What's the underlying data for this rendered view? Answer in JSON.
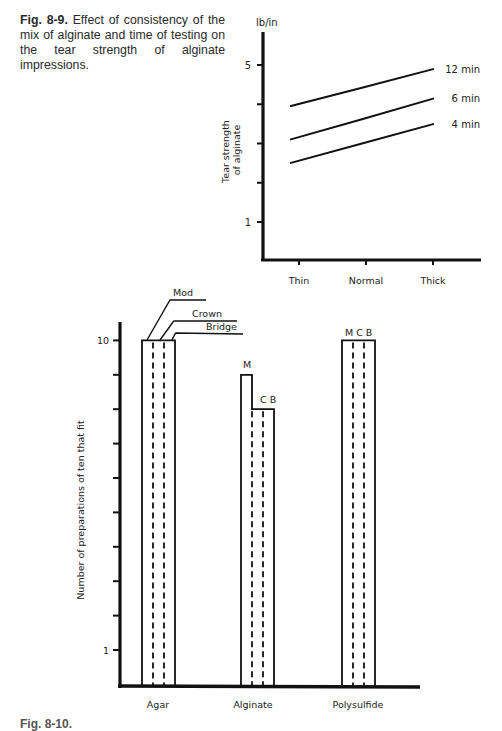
{
  "caption_top": {
    "label": "Fig. 8-9.",
    "text": " Effect of consistency of the mix of alginate and time of testing on the tear strength of alginate impressions."
  },
  "caption_bottom": {
    "label": "Fig. 8-10."
  },
  "chart_data": [
    {
      "type": "line",
      "title": "Effect of consistency of the mix of alginate and time of testing on the tear strength of alginate impressions",
      "xlabel": "",
      "ylabel": "Tear strength of alginate",
      "y_unit": "lb/in",
      "categories": [
        "Thin",
        "Normal",
        "Thick"
      ],
      "y_ticks": [
        1,
        2,
        3,
        4,
        5
      ],
      "y_tick_labels": {
        "1": "1",
        "5": "5"
      },
      "ylim": [
        0,
        6
      ],
      "grid": false,
      "legend_position": "inline-right",
      "series": [
        {
          "name": "12 min",
          "values": [
            3.95,
            4.42,
            4.9
          ]
        },
        {
          "name": "6 min",
          "values": [
            3.1,
            3.62,
            4.15
          ]
        },
        {
          "name": "4 min",
          "values": [
            2.5,
            3.0,
            3.5
          ]
        }
      ]
    },
    {
      "type": "bar",
      "title": "",
      "xlabel": "",
      "ylabel": "Number of preparations of ten that fit",
      "categories": [
        "Agar",
        "Alginate",
        "Polysulfide"
      ],
      "y_ticks": [
        1,
        2,
        3,
        4,
        5,
        6,
        7,
        8,
        9,
        10
      ],
      "y_tick_labels": {
        "1": "1",
        "10": "10"
      },
      "ylim": [
        0,
        11
      ],
      "grid": false,
      "sub_categories": [
        "Mod",
        "Crown",
        "Bridge"
      ],
      "sub_category_abbrev": [
        "M",
        "C",
        "B"
      ],
      "series": [
        {
          "name": "Mod",
          "values": [
            10,
            9,
            10
          ]
        },
        {
          "name": "Crown",
          "values": [
            10,
            8,
            10
          ]
        },
        {
          "name": "Bridge",
          "values": [
            10,
            8,
            10
          ]
        }
      ],
      "annotations": {
        "agar": [
          "Mod",
          "Crown",
          "Bridge"
        ],
        "alginate": [
          "M",
          "C B"
        ],
        "polysulfide": [
          "M C B"
        ]
      }
    }
  ]
}
